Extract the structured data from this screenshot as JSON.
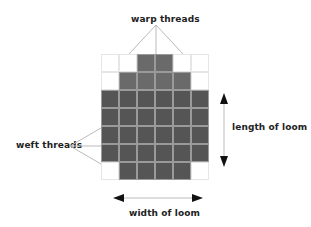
{
  "labels": {
    "warp": "warp threads",
    "weft": "weft threads",
    "length": "length of loom",
    "width": "width of loom"
  },
  "grid": {
    "columns": 6,
    "rows": 7,
    "pattern": [
      [
        0,
        0,
        1,
        1,
        0,
        0
      ],
      [
        0,
        1,
        1,
        1,
        1,
        0
      ],
      [
        2,
        2,
        2,
        2,
        2,
        2
      ],
      [
        2,
        2,
        2,
        2,
        2,
        2
      ],
      [
        2,
        2,
        2,
        2,
        2,
        2
      ],
      [
        2,
        2,
        2,
        2,
        2,
        2
      ],
      [
        0,
        2,
        2,
        2,
        2,
        0
      ]
    ]
  },
  "colors": {
    "filled_light": "#6a6a6a",
    "filled_dark": "#555555",
    "grid_line": "#e6e6e6",
    "callout_line": "#bbbbbb",
    "arrow": "#111111"
  }
}
